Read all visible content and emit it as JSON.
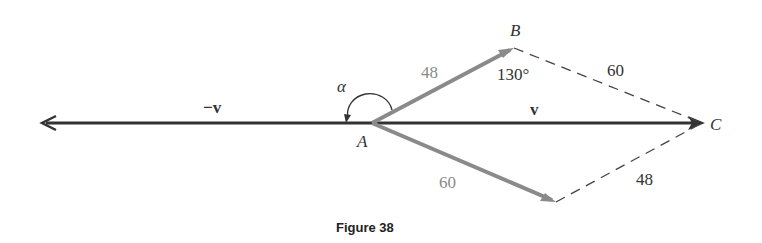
{
  "figure": {
    "caption": "Figure 38",
    "points": {
      "A": "A",
      "B": "B",
      "C": "C"
    },
    "vectors": {
      "v": "v",
      "neg_v": "−v"
    },
    "lengths": {
      "AB": "48",
      "BC": "60",
      "AD": "60",
      "DC": "48"
    },
    "angles": {
      "alpha": "α",
      "B": "130°"
    },
    "colors": {
      "main_vector": "#333333",
      "component_vectors": "#8a8a8a",
      "dashed": "#444444"
    }
  }
}
